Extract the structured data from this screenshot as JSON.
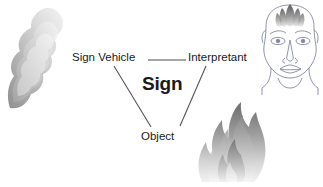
{
  "diagram": {
    "title_text": "Sign",
    "nodes": [
      {
        "id": "sign-vehicle",
        "label": "Sign Vehicle"
      },
      {
        "id": "interpretant",
        "label": "Interpretant"
      },
      {
        "id": "object",
        "label": "Object"
      }
    ],
    "center_label": "Sign",
    "edges": [
      {
        "from": "sign-vehicle",
        "to": "interpretant",
        "style": "horizontal"
      },
      {
        "from": "sign-vehicle",
        "to": "object",
        "style": "diagonal"
      },
      {
        "from": "interpretant",
        "to": "object",
        "style": "diagonal"
      }
    ],
    "illustrations": [
      {
        "id": "smoke",
        "name": "smoke-plume-illustration"
      },
      {
        "id": "fire",
        "name": "flame-illustration"
      },
      {
        "id": "face",
        "name": "human-face-illustration"
      }
    ],
    "colors": {
      "background": "#ffffff",
      "text": "#1a1a1a",
      "line": "#555555",
      "smoke_dark": "#9a9a9a",
      "smoke_light": "#e4e4e4",
      "flame_dark": "#6e6e6e",
      "flame_light": "#e8e8e8",
      "face_outline": "#7a7a85"
    }
  }
}
